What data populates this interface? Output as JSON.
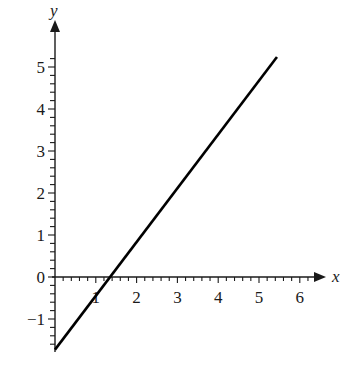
{
  "chart_data": {
    "type": "line",
    "title": "",
    "xlabel": "x",
    "ylabel": "y",
    "xlim": [
      0,
      6.3
    ],
    "ylim": [
      -1.75,
      5.4
    ],
    "x_ticks": [
      {
        "value": 1,
        "label": "1"
      },
      {
        "value": 2,
        "label": "2"
      },
      {
        "value": 3,
        "label": "3"
      },
      {
        "value": 4,
        "label": "4"
      },
      {
        "value": 5,
        "label": "5"
      },
      {
        "value": 6,
        "label": "6"
      }
    ],
    "y_ticks": [
      {
        "value": -1,
        "label": "−1"
      },
      {
        "value": 0,
        "label": "0"
      },
      {
        "value": 1,
        "label": "1"
      },
      {
        "value": 2,
        "label": "2"
      },
      {
        "value": 3,
        "label": "3"
      },
      {
        "value": 4,
        "label": "4"
      },
      {
        "value": 5,
        "label": "5"
      }
    ],
    "minor_ticks_per_unit": 5,
    "grid": false,
    "legend": null,
    "series": [
      {
        "name": "line",
        "color": "#000000",
        "x": [
          0,
          5.44
        ],
        "y": [
          -1.73,
          5.24
        ]
      }
    ],
    "annotations": []
  },
  "colors": {
    "axis": "#1a1a1a",
    "line": "#000000",
    "background": "#ffffff"
  }
}
